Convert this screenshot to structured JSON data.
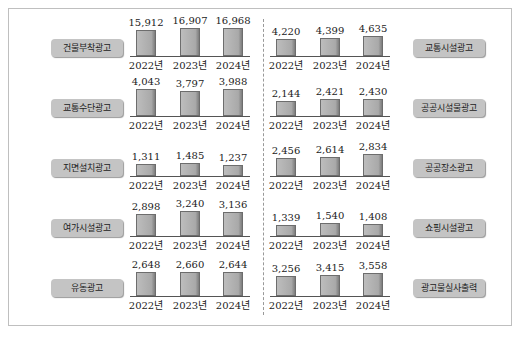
{
  "chart_data": {
    "type": "bar",
    "title": "",
    "categories": [
      "2022년",
      "2023년",
      "2024년"
    ],
    "series": [
      {
        "name": "건물부착광고",
        "values": [
          15912,
          16907,
          16968
        ]
      },
      {
        "name": "교통수단광고",
        "values": [
          4043,
          3797,
          3988
        ]
      },
      {
        "name": "지면설치광고",
        "values": [
          1311,
          1485,
          1237
        ]
      },
      {
        "name": "여가시설광고",
        "values": [
          2898,
          3240,
          3136
        ]
      },
      {
        "name": "유동광고",
        "values": [
          2648,
          2660,
          2644
        ]
      },
      {
        "name": "교통시설광고",
        "values": [
          4220,
          4399,
          4635
        ]
      },
      {
        "name": "공공시설물광고",
        "values": [
          2144,
          2421,
          2430
        ]
      },
      {
        "name": "공공장소광고",
        "values": [
          2456,
          2614,
          2834
        ]
      },
      {
        "name": "쇼핑시설광고",
        "values": [
          1339,
          1540,
          1408
        ]
      },
      {
        "name": "광고물실사출력",
        "values": [
          3256,
          3415,
          3558
        ]
      }
    ],
    "xlabel": "",
    "ylabel": "",
    "grid": false,
    "legend": "label pills beside each small-multiple panel"
  },
  "panels": [
    {
      "label": "건물부착광고",
      "years": [
        "2022년",
        "2023년",
        "2024년"
      ],
      "values": [
        "15,912",
        "16,907",
        "16,968"
      ],
      "heights": [
        26,
        28,
        28
      ],
      "side": "left"
    },
    {
      "label": "교통수단광고",
      "years": [
        "2022년",
        "2023년",
        "2024년"
      ],
      "values": [
        "4,043",
        "3,797",
        "3,988"
      ],
      "heights": [
        27,
        25,
        27
      ],
      "side": "left"
    },
    {
      "label": "지면설치광고",
      "years": [
        "2022년",
        "2023년",
        "2024년"
      ],
      "values": [
        "1,311",
        "1,485",
        "1,237"
      ],
      "heights": [
        12,
        13,
        11
      ],
      "side": "left"
    },
    {
      "label": "여가시설광고",
      "years": [
        "2022년",
        "2023년",
        "2024년"
      ],
      "values": [
        "2,898",
        "3,240",
        "3,136"
      ],
      "heights": [
        22,
        25,
        24
      ],
      "side": "left"
    },
    {
      "label": "유동광고",
      "years": [
        "2022년",
        "2023년",
        "2024년"
      ],
      "values": [
        "2,648",
        "2,660",
        "2,644"
      ],
      "heights": [
        24,
        24,
        24
      ],
      "side": "left"
    },
    {
      "label": "교통시설광고",
      "years": [
        "2022년",
        "2023년",
        "2024년"
      ],
      "values": [
        "4,220",
        "4,399",
        "4,635"
      ],
      "heights": [
        17,
        18,
        20
      ],
      "side": "right"
    },
    {
      "label": "공공시설물광고",
      "years": [
        "2022년",
        "2023년",
        "2024년"
      ],
      "values": [
        "2,144",
        "2,421",
        "2,430"
      ],
      "heights": [
        15,
        17,
        17
      ],
      "side": "right"
    },
    {
      "label": "공공장소광고",
      "years": [
        "2022년",
        "2023년",
        "2024년"
      ],
      "values": [
        "2,456",
        "2,614",
        "2,834"
      ],
      "heights": [
        18,
        19,
        22
      ],
      "side": "right"
    },
    {
      "label": "쇼핑시설광고",
      "years": [
        "2022년",
        "2023년",
        "2024년"
      ],
      "values": [
        "1,339",
        "1,540",
        "1,408"
      ],
      "heights": [
        11,
        13,
        12
      ],
      "side": "right"
    },
    {
      "label": "광고물실사출력",
      "years": [
        "2022년",
        "2023년",
        "2024년"
      ],
      "values": [
        "3,256",
        "3,415",
        "3,558"
      ],
      "heights": [
        20,
        21,
        23
      ],
      "side": "right"
    }
  ]
}
